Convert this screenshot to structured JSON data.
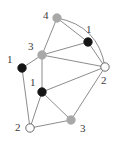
{
  "figure": {
    "kind": "undirected-graph-drawing",
    "background_color": "#ffffff",
    "edge_color": "#6e6e6e",
    "label_color": "#3a3a3a",
    "node_fill_colors": {
      "black": "#151515",
      "gray": "#a8a8a8",
      "white": "#ffffff"
    },
    "node_stroke_color": "#5a5a5a",
    "node_radius": 4.2
  },
  "nodes": [
    {
      "id": "n4",
      "label": "4",
      "fill": "gray",
      "x": 57,
      "y": 18,
      "label_x": 43,
      "label_y": 10
    },
    {
      "id": "n1a",
      "label": "1",
      "fill": "black",
      "x": 88,
      "y": 42,
      "label_x": 86,
      "label_y": 24
    },
    {
      "id": "n3a",
      "label": "3",
      "fill": "gray",
      "x": 42,
      "y": 55,
      "label_x": 28,
      "label_y": 41
    },
    {
      "id": "n1b",
      "label": "1",
      "fill": "black",
      "x": 22,
      "y": 68,
      "label_x": 7,
      "label_y": 54
    },
    {
      "id": "n2a",
      "label": "2",
      "fill": "white",
      "x": 105,
      "y": 67,
      "label_x": 101,
      "label_y": 75
    },
    {
      "id": "n1c",
      "label": "1",
      "fill": "black",
      "x": 42,
      "y": 92,
      "label_x": 30,
      "label_y": 77
    },
    {
      "id": "n3b",
      "label": "3",
      "fill": "gray",
      "x": 71,
      "y": 120,
      "label_x": 80,
      "label_y": 123
    },
    {
      "id": "n2b",
      "label": "2",
      "fill": "white",
      "x": 30,
      "y": 128,
      "label_x": 15,
      "label_y": 122
    }
  ],
  "edges": [
    {
      "from": "n4",
      "to": "n1a",
      "curved": false
    },
    {
      "from": "n4",
      "to": "n3a",
      "curved": false
    },
    {
      "from": "n4",
      "to": "n2a",
      "curved": true
    },
    {
      "from": "n1a",
      "to": "n3a",
      "curved": false
    },
    {
      "from": "n1a",
      "to": "n2a",
      "curved": false
    },
    {
      "from": "n3a",
      "to": "n1b",
      "curved": false
    },
    {
      "from": "n3a",
      "to": "n1c",
      "curved": false
    },
    {
      "from": "n3a",
      "to": "n2a",
      "curved": false
    },
    {
      "from": "n1b",
      "to": "n2b",
      "curved": false
    },
    {
      "from": "n1c",
      "to": "n2a",
      "curved": false
    },
    {
      "from": "n1c",
      "to": "n2b",
      "curved": false
    },
    {
      "from": "n1c",
      "to": "n3b",
      "curved": false
    },
    {
      "from": "n3b",
      "to": "n2b",
      "curved": false
    },
    {
      "from": "n3b",
      "to": "n2a",
      "curved": false
    }
  ]
}
